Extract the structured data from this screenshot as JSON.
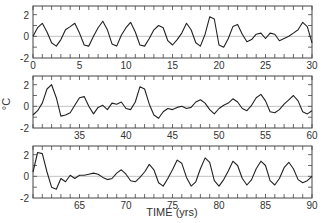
{
  "chart_data": {
    "type": "line",
    "title": "",
    "xlabel": "TIME (yrs)",
    "ylabel": "°C",
    "grid": false,
    "panels": [
      {
        "xlim": [
          0,
          30
        ],
        "ylim": [
          -2,
          2.8
        ],
        "xticks": [
          0,
          5,
          10,
          15,
          20,
          25,
          30
        ],
        "yticks": [
          -2,
          0,
          2
        ],
        "x": [
          0,
          0.5,
          1,
          1.5,
          2,
          2.5,
          3,
          3.5,
          4,
          4.5,
          5,
          5.5,
          6,
          6.5,
          7,
          7.5,
          8,
          8.5,
          9,
          9.5,
          10,
          10.5,
          11,
          11.5,
          12,
          12.5,
          13,
          13.5,
          14,
          14.5,
          15,
          15.5,
          16,
          16.5,
          17,
          17.5,
          18,
          18.5,
          19,
          19.5,
          20,
          20.5,
          21,
          21.5,
          22,
          22.5,
          23,
          23.5,
          24,
          24.5,
          25,
          25.5,
          26,
          26.5,
          27,
          27.5,
          28,
          28.5,
          29,
          29.5,
          30
        ],
        "values": [
          0.0,
          0.8,
          1.2,
          0.4,
          -0.6,
          -0.9,
          -0.3,
          0.6,
          0.9,
          1.2,
          0.3,
          -0.8,
          -0.9,
          0.0,
          0.8,
          1.4,
          0.6,
          -0.7,
          -0.9,
          0.1,
          0.8,
          1.3,
          0.4,
          -0.8,
          -0.9,
          -0.2,
          0.6,
          1.0,
          0.8,
          -0.4,
          -0.8,
          -0.3,
          0.3,
          1.2,
          0.6,
          -0.6,
          -0.9,
          0.2,
          1.8,
          1.6,
          -0.8,
          -1.0,
          -0.2,
          0.9,
          1.1,
          0.2,
          -0.5,
          -0.3,
          0.2,
          0.3,
          -0.2,
          0.3,
          0.2,
          -0.4,
          -0.2,
          0.0,
          0.3,
          0.6,
          1.3,
          0.9,
          -0.6
        ]
      },
      {
        "xlim": [
          30,
          60
        ],
        "ylim": [
          -2,
          2.8
        ],
        "xticks": [
          35,
          40,
          45,
          50,
          55,
          60
        ],
        "yticks": [
          -2,
          0,
          2
        ],
        "x": [
          30,
          30.5,
          31,
          31.5,
          32,
          32.5,
          33,
          33.5,
          34,
          34.5,
          35,
          35.5,
          36,
          36.5,
          37,
          37.5,
          38,
          38.5,
          39,
          39.5,
          40,
          40.5,
          41,
          41.5,
          42,
          42.5,
          43,
          43.5,
          44,
          44.5,
          45,
          45.5,
          46,
          46.5,
          47,
          47.5,
          48,
          48.5,
          49,
          49.5,
          50,
          50.5,
          51,
          51.5,
          52,
          52.5,
          53,
          53.5,
          54,
          54.5,
          55,
          55.5,
          56,
          56.5,
          57,
          57.5,
          58,
          58.5,
          59,
          59.5,
          60
        ],
        "values": [
          -0.8,
          -0.4,
          0.3,
          1.6,
          2.0,
          0.8,
          -0.9,
          -0.8,
          -0.6,
          0.1,
          0.8,
          0.9,
          0.0,
          -0.7,
          -0.1,
          0.1,
          -0.3,
          0.3,
          0.2,
          0.4,
          -0.2,
          -0.3,
          0.4,
          1.8,
          1.6,
          0.2,
          -0.8,
          -1.1,
          -0.5,
          -0.2,
          -0.3,
          -0.1,
          0.0,
          -0.2,
          -0.1,
          0.4,
          0.6,
          0.3,
          -0.3,
          -0.7,
          -0.2,
          0.1,
          0.3,
          0.7,
          0.4,
          -0.2,
          -0.4,
          0.1,
          0.8,
          1.1,
          0.5,
          -0.5,
          -0.6,
          -0.3,
          0.2,
          0.6,
          1.0,
          0.5,
          -0.5,
          -0.7,
          -0.4
        ]
      },
      {
        "xlim": [
          60,
          90
        ],
        "ylim": [
          -2,
          2.8
        ],
        "xticks": [
          65,
          70,
          75,
          80,
          85,
          90
        ],
        "yticks": [
          -2,
          0,
          2
        ],
        "x": [
          60,
          60.5,
          61,
          61.5,
          62,
          62.5,
          63,
          63.5,
          64,
          64.5,
          65,
          65.5,
          66,
          66.5,
          67,
          67.5,
          68,
          68.5,
          69,
          69.5,
          70,
          70.5,
          71,
          71.5,
          72,
          72.5,
          73,
          73.5,
          74,
          74.5,
          75,
          75.5,
          76,
          76.5,
          77,
          77.5,
          78,
          78.5,
          79,
          79.5,
          80,
          80.5,
          81,
          81.5,
          82,
          82.5,
          83,
          83.5,
          84,
          84.5,
          85,
          85.5,
          86,
          86.5,
          87,
          87.5,
          88,
          88.5,
          89,
          89.5,
          90
        ],
        "values": [
          0.4,
          2.2,
          2.1,
          0.4,
          -1.0,
          -1.2,
          -0.2,
          -0.5,
          0.1,
          -0.2,
          0.1,
          0.1,
          0.2,
          0.3,
          0.2,
          -0.1,
          -0.3,
          -0.2,
          0.3,
          0.6,
          0.2,
          -0.4,
          -0.5,
          -0.1,
          0.4,
          1.1,
          0.6,
          -0.6,
          -0.9,
          -0.2,
          0.6,
          1.5,
          1.2,
          -0.1,
          -0.9,
          -0.5,
          0.7,
          1.7,
          1.3,
          -0.4,
          -0.9,
          -0.3,
          0.5,
          1.4,
          1.0,
          -0.2,
          -0.8,
          -0.3,
          0.7,
          1.4,
          1.0,
          -0.4,
          -0.8,
          -0.2,
          0.8,
          1.3,
          0.7,
          -0.3,
          -0.6,
          -0.4,
          0.0
        ]
      }
    ]
  },
  "labels": {
    "ylabel": "°C",
    "xlabel": "TIME (yrs)"
  }
}
